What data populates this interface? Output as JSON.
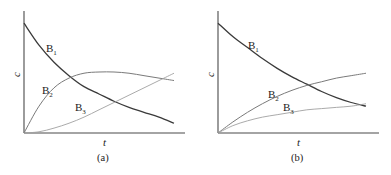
{
  "chart_data": [
    {
      "type": "line",
      "panel_label": "(a)",
      "xlabel": "t",
      "ylabel": "c",
      "xlim": [
        0,
        1
      ],
      "ylim": [
        0,
        1
      ],
      "grid": false,
      "series": [
        {
          "name": "B1",
          "name_main": "B",
          "name_sub": "1",
          "color": "#3a3a3a",
          "x": [
            0,
            0.1,
            0.2,
            0.3,
            0.4,
            0.5,
            0.6,
            0.7,
            0.8,
            0.9,
            1.0
          ],
          "y": [
            0.9,
            0.72,
            0.58,
            0.47,
            0.38,
            0.32,
            0.26,
            0.21,
            0.17,
            0.13,
            0.08
          ]
        },
        {
          "name": "B2",
          "name_main": "B",
          "name_sub": "2",
          "color": "#7a7a7a",
          "x": [
            0,
            0.1,
            0.2,
            0.3,
            0.4,
            0.5,
            0.6,
            0.7,
            0.8,
            0.9,
            1.0
          ],
          "y": [
            0.0,
            0.22,
            0.37,
            0.45,
            0.49,
            0.5,
            0.5,
            0.49,
            0.47,
            0.45,
            0.43
          ]
        },
        {
          "name": "B3",
          "name_main": "B",
          "name_sub": "3",
          "color": "#a0a0a0",
          "x": [
            0,
            0.1,
            0.2,
            0.3,
            0.4,
            0.5,
            0.6,
            0.7,
            0.8,
            0.9,
            1.0
          ],
          "y": [
            0.0,
            0.01,
            0.04,
            0.08,
            0.13,
            0.19,
            0.25,
            0.31,
            0.37,
            0.43,
            0.49
          ]
        }
      ]
    },
    {
      "type": "line",
      "panel_label": "(b)",
      "xlabel": "t",
      "ylabel": "c",
      "xlim": [
        0,
        1
      ],
      "ylim": [
        0,
        1
      ],
      "grid": false,
      "series": [
        {
          "name": "B1",
          "name_main": "B",
          "name_sub": "1",
          "color": "#3a3a3a",
          "x": [
            0,
            0.1,
            0.2,
            0.3,
            0.4,
            0.5,
            0.6,
            0.7,
            0.8,
            0.9,
            1.0
          ],
          "y": [
            0.9,
            0.79,
            0.7,
            0.61,
            0.53,
            0.46,
            0.4,
            0.34,
            0.29,
            0.25,
            0.22
          ]
        },
        {
          "name": "B2",
          "name_main": "B",
          "name_sub": "2",
          "color": "#7a7a7a",
          "x": [
            0,
            0.1,
            0.2,
            0.3,
            0.4,
            0.5,
            0.6,
            0.7,
            0.8,
            0.9,
            1.0
          ],
          "y": [
            0.0,
            0.09,
            0.17,
            0.24,
            0.3,
            0.35,
            0.39,
            0.42,
            0.45,
            0.47,
            0.49
          ]
        },
        {
          "name": "B3",
          "name_main": "B",
          "name_sub": "3",
          "color": "#a0a0a0",
          "x": [
            0,
            0.1,
            0.2,
            0.3,
            0.4,
            0.5,
            0.6,
            0.7,
            0.8,
            0.9,
            1.0
          ],
          "y": [
            0.0,
            0.06,
            0.1,
            0.13,
            0.15,
            0.17,
            0.19,
            0.2,
            0.21,
            0.22,
            0.24
          ]
        }
      ]
    }
  ]
}
